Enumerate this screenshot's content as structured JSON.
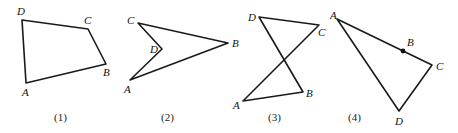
{
  "figures": [
    {
      "caption": "(1)",
      "shape": "convex quadrilateral",
      "vertices": {
        "A": {
          "label": "A",
          "x": 26,
          "y": 83,
          "lx": 22,
          "ly": 96
        },
        "B": {
          "label": "B",
          "x": 106,
          "y": 64,
          "lx": 103,
          "ly": 76
        },
        "C": {
          "label": "C",
          "x": 88,
          "y": 29,
          "lx": 84,
          "ly": 24
        },
        "D": {
          "label": "D",
          "x": 22,
          "y": 20,
          "lx": 17,
          "ly": 15
        }
      },
      "path_order": [
        "A",
        "B",
        "C",
        "D"
      ],
      "caption_pos": {
        "x": 61,
        "y": 121
      }
    },
    {
      "caption": "(2)",
      "shape": "concave quadrilateral (dart)",
      "vertices": {
        "A": {
          "label": "A",
          "x": 130,
          "y": 80,
          "lx": 124,
          "ly": 93
        },
        "B": {
          "label": "B",
          "x": 228,
          "y": 43,
          "lx": 232,
          "ly": 47
        },
        "C": {
          "label": "C",
          "x": 138,
          "y": 23,
          "lx": 127,
          "ly": 24
        },
        "D": {
          "label": "D",
          "x": 162,
          "y": 49,
          "lx": 150,
          "ly": 53
        }
      },
      "path_order": [
        "A",
        "B",
        "C",
        "D"
      ],
      "caption_pos": {
        "x": 168,
        "y": 121
      }
    },
    {
      "caption": "(3)",
      "shape": "self-intersecting quadrilateral",
      "vertices": {
        "A": {
          "label": "A",
          "x": 243,
          "y": 101,
          "lx": 233,
          "ly": 109
        },
        "B": {
          "label": "B",
          "x": 303,
          "y": 92,
          "lx": 306,
          "ly": 97
        },
        "C": {
          "label": "C",
          "x": 319,
          "y": 25,
          "lx": 318,
          "ly": 36
        },
        "D": {
          "label": "D",
          "x": 259,
          "y": 17,
          "lx": 248,
          "ly": 21
        }
      },
      "path_order": [
        "A",
        "B",
        "D",
        "C"
      ],
      "caption_pos": {
        "x": 275,
        "y": 121
      }
    },
    {
      "caption": "(4)",
      "shape": "triangle with B on side AC",
      "vertices": {
        "A": {
          "label": "A",
          "x": 337,
          "y": 19,
          "lx": 330,
          "ly": 19
        },
        "B": {
          "label": "B",
          "x": 403,
          "y": 51,
          "lx": 407,
          "ly": 46
        },
        "C": {
          "label": "C",
          "x": 432,
          "y": 65,
          "lx": 436,
          "ly": 70
        },
        "D": {
          "label": "D",
          "x": 399,
          "y": 111,
          "lx": 395,
          "ly": 125
        }
      },
      "path_order": [
        "A",
        "C",
        "D"
      ],
      "marked_point": "B",
      "caption_pos": {
        "x": 355,
        "y": 121
      }
    }
  ]
}
